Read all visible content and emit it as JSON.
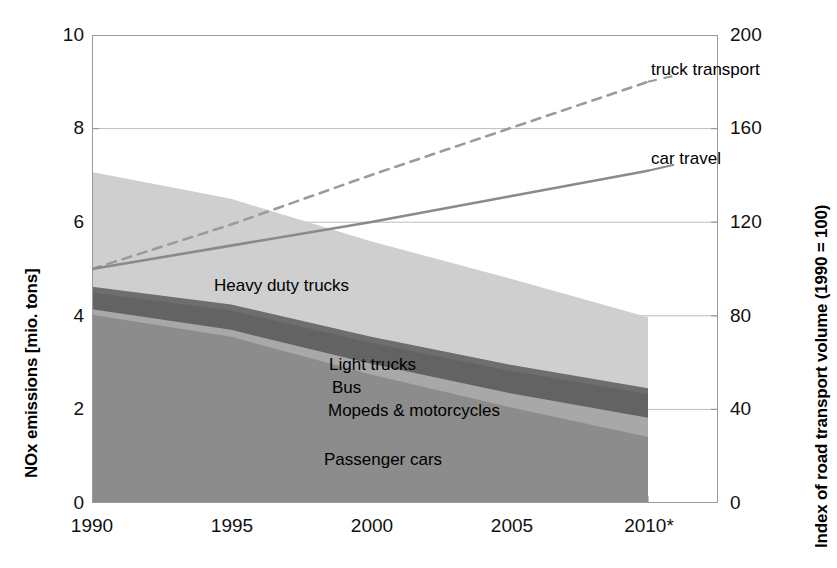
{
  "chart_data": {
    "type": "area",
    "title": "",
    "subtitle": "",
    "xlabel": "",
    "ylabel": "NOx emissions [mio. tons]",
    "y2label": "Index of road transport volume (1990 = 100)",
    "grid": true,
    "legend_position": "in-plot annotations",
    "x": [
      1990,
      1995,
      2000,
      2005,
      2010
    ],
    "xtick_labels": [
      "1990",
      "1995",
      "2000",
      "2005",
      "2010*"
    ],
    "ylim": [
      0,
      10
    ],
    "ytick_labels": [
      "0",
      "2",
      "4",
      "6",
      "8",
      "10"
    ],
    "ytick_values": [
      0,
      2,
      4,
      6,
      8,
      10
    ],
    "y2lim": [
      0,
      200
    ],
    "y2tick_labels": [
      "0",
      "40",
      "80",
      "120",
      "160",
      "200"
    ],
    "y2tick_values": [
      0,
      40,
      80,
      120,
      160,
      200
    ],
    "stack_order_bottom_to_top": [
      "Passenger cars",
      "Mopeds & motorcycles",
      "Bus",
      "Light trucks",
      "Heavy duty trucks"
    ],
    "series": [
      {
        "name": "Passenger cars",
        "axis": "left",
        "kind": "area",
        "color": "#8c8c8c",
        "values": [
          4.02,
          3.55,
          2.75,
          2.05,
          1.41
        ],
        "cumulative_top": [
          4.02,
          3.55,
          2.75,
          2.05,
          1.41
        ]
      },
      {
        "name": "Mopeds & motorcycles",
        "axis": "left",
        "kind": "area",
        "color": "#a8a8a8",
        "values": [
          0.12,
          0.15,
          0.23,
          0.3,
          0.41
        ],
        "cumulative_top": [
          4.14,
          3.7,
          2.98,
          2.35,
          1.82
        ]
      },
      {
        "name": "Bus",
        "axis": "left",
        "kind": "area",
        "color": "#636363",
        "values": [
          0.36,
          0.41,
          0.45,
          0.48,
          0.51
        ],
        "cumulative_top": [
          4.5,
          4.11,
          3.43,
          2.83,
          2.33
        ]
      },
      {
        "name": "Light trucks",
        "axis": "left",
        "kind": "area",
        "color": "#6e6e6e",
        "values": [
          0.12,
          0.13,
          0.13,
          0.13,
          0.12
        ],
        "cumulative_top": [
          4.62,
          4.24,
          3.56,
          2.96,
          2.45
        ]
      },
      {
        "name": "Heavy duty trucks",
        "axis": "left",
        "kind": "area",
        "color": "#cfcfcf",
        "values": [
          2.45,
          2.26,
          2.04,
          1.84,
          1.52
        ],
        "cumulative_top": [
          7.07,
          6.5,
          5.6,
          4.8,
          3.97
        ]
      },
      {
        "name": "truck transport",
        "axis": "right",
        "kind": "line",
        "style": "dashed",
        "color": "#9b9b9b",
        "values": [
          100,
          119,
          140,
          160,
          180
        ]
      },
      {
        "name": "car travel",
        "axis": "right",
        "kind": "line",
        "style": "solid",
        "color": "#8a8a8a",
        "values": [
          100,
          110,
          120,
          131,
          142
        ]
      }
    ],
    "annotations": [
      {
        "name": "Heavy duty trucks",
        "text": "Heavy duty trucks"
      },
      {
        "name": "Light trucks",
        "text": "Light trucks"
      },
      {
        "name": "Bus",
        "text": "Bus"
      },
      {
        "name": "Mopeds & motorcycles",
        "text": "Mopeds & motorcycles"
      },
      {
        "name": "Passenger cars",
        "text": "Passenger cars"
      },
      {
        "name": "truck transport",
        "text": "truck transport"
      },
      {
        "name": "car travel",
        "text": "car travel"
      }
    ]
  },
  "axes": {
    "left": {
      "title": "NOx emissions [mio. tons]",
      "ticks": [
        "10",
        "8",
        "6",
        "4",
        "2",
        "0"
      ]
    },
    "right": {
      "title": "Index of road transport volume (1990 = 100)",
      "ticks": [
        "200",
        "160",
        "120",
        "80",
        "40",
        "0"
      ]
    },
    "x": {
      "ticks": [
        "1990",
        "1995",
        "2000",
        "2005",
        "2010*"
      ]
    }
  },
  "labels": {
    "heavy_duty_trucks": "Heavy duty trucks",
    "light_trucks": "Light trucks",
    "bus": "Bus",
    "mopeds_motorcycles": "Mopeds & motorcycles",
    "passenger_cars": "Passenger cars",
    "truck_transport": "truck transport",
    "car_travel": "car travel"
  },
  "colors": {
    "heavy_duty_trucks": "#cfcfcf",
    "light_trucks": "#6e6e6e",
    "bus": "#636363",
    "mopeds_motorcycles": "#a8a8a8",
    "passenger_cars": "#8c8c8c",
    "truck_transport_line": "#9b9b9b",
    "car_travel_line": "#8a8a8a",
    "axis": "#9a9a9a",
    "grid": "#bdbdbd",
    "text": "#000000"
  }
}
